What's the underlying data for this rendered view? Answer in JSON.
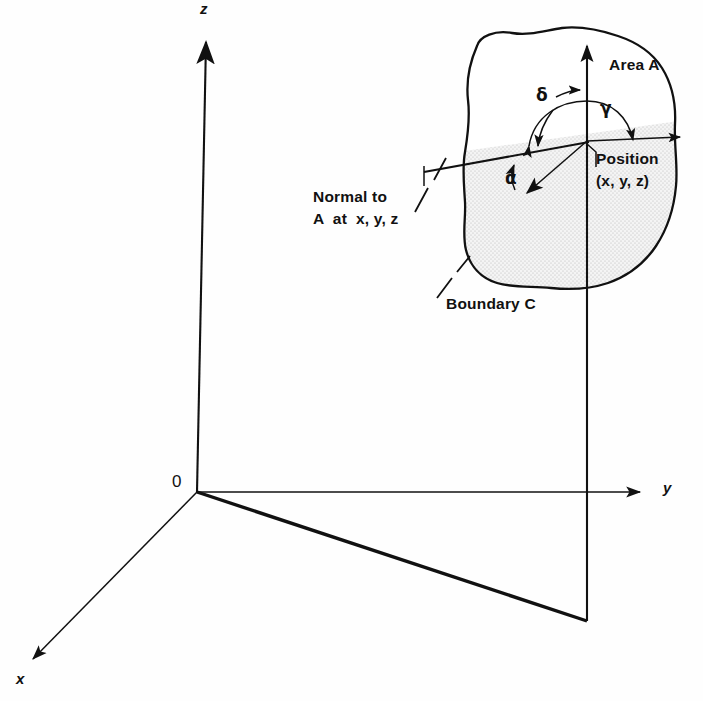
{
  "figure": {
    "background_color": "#fefefe",
    "ink_color": "#111111",
    "shade_color": "#ededed"
  },
  "axes": {
    "z_label": "z",
    "y_label": "y",
    "x_label": "x",
    "origin_label": "0"
  },
  "annotations": {
    "area_label": "Area A",
    "boundary_label": "Boundary C",
    "normal_label_line1": "Normal to",
    "normal_label_line2": "A  at  x, y, z",
    "position_label_line1": "Position",
    "position_label_line2": "(x, y, z)",
    "angle_alpha": "α",
    "angle_gamma": "γ",
    "angle_delta": "δ"
  }
}
